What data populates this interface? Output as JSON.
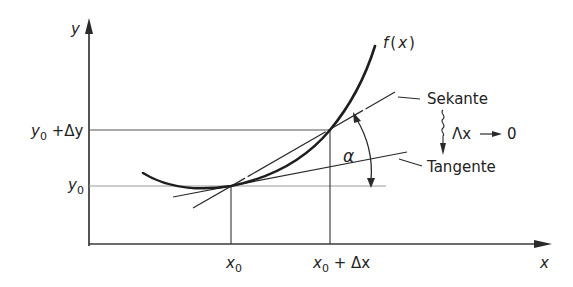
{
  "diagram": {
    "axes": {
      "x_label": "x",
      "y_label": "y"
    },
    "function_label": "f(x)",
    "function_label_parts": {
      "f": "f",
      "open": "(",
      "x": "x",
      "close": ")"
    },
    "ticks": {
      "x0": {
        "base": "x",
        "sub": "0"
      },
      "x0_plus_dx": {
        "base": "x",
        "sub": "0",
        "rest": " + Δx"
      },
      "y0": {
        "base": "y",
        "sub": "0"
      },
      "y0_plus_dy": {
        "base": "y",
        "sub": "0",
        "rest": " +Δy"
      }
    },
    "lines": {
      "secant_label": "Sekante",
      "tangent_label": "Tangente"
    },
    "angle_label": "α",
    "limit_annotation": "Δx → 0",
    "limit_parts": {
      "dx": "Λx",
      "arrow": "→",
      "zero": "0"
    },
    "colors": {
      "stroke": "#2a2a2a",
      "light_line": "#8a8a8a",
      "background": "#ffffff"
    }
  }
}
